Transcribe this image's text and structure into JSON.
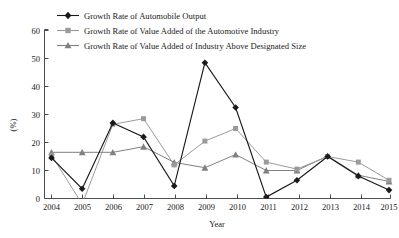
{
  "chart_data": {
    "type": "line",
    "title": "",
    "xlabel": "Year",
    "ylabel": "(%)",
    "categories": [
      "2004",
      "2005",
      "2006",
      "2007",
      "2008",
      "2009",
      "2010",
      "2011",
      "2012",
      "2013",
      "2014",
      "2015"
    ],
    "x": [
      2004,
      2005,
      2006,
      2007,
      2008,
      2009,
      2010,
      2011,
      2012,
      2013,
      2014,
      2015
    ],
    "ylim": [
      0,
      60
    ],
    "yticks": [
      0,
      10,
      20,
      30,
      40,
      50,
      60
    ],
    "ytick_labels": [
      "0",
      "10",
      "20",
      "30",
      "40",
      "50",
      "60"
    ],
    "xlim": [
      2004,
      2015
    ],
    "grid": false,
    "legend_position": "top-center",
    "series": [
      {
        "name": "Growth Rate of Automobile Output",
        "marker": "diamond",
        "color": "#1a1a1a",
        "values": [
          14.5,
          3.5,
          27.0,
          22.0,
          4.5,
          48.5,
          32.5,
          0.5,
          6.5,
          15.0,
          8.0,
          3.0
        ]
      },
      {
        "name": "Growth Rate of Value Added of the Automotive Industry",
        "marker": "square",
        "color": "#9a9a9a",
        "values": [
          15.5,
          -2.0,
          26.5,
          28.5,
          12.0,
          20.5,
          25.0,
          13.0,
          10.5,
          15.0,
          13.0,
          6.5
        ]
      },
      {
        "name": "Growth Rate of Value Added of Industry Above Designated Size",
        "marker": "triangle",
        "color": "#808080",
        "values": [
          16.5,
          16.5,
          16.5,
          18.5,
          12.9,
          11.0,
          15.7,
          10.0,
          10.0,
          15.2,
          8.3,
          6.1
        ]
      }
    ]
  },
  "axes": {
    "ylabel": "(%)",
    "xlabel": "Year",
    "ytick_labels": [
      "60",
      "50",
      "40",
      "30",
      "20",
      "10",
      "0"
    ],
    "xtick_labels": [
      "2004",
      "2005",
      "2006",
      "2007",
      "2008",
      "2009",
      "2010",
      "2011",
      "2012",
      "2013",
      "2014",
      "2015"
    ]
  },
  "legend": {
    "items": [
      {
        "label": "Growth Rate of Automobile Output",
        "marker": "diamond-marker",
        "color": "#1a1a1a"
      },
      {
        "label": "Growth Rate of Value Added of the Automotive Industry",
        "marker": "square-marker",
        "color": "#9a9a9a"
      },
      {
        "label": "Growth Rate of Value Added of Industry Above Designated Size",
        "marker": "triangle-marker",
        "color": "#808080"
      }
    ]
  }
}
